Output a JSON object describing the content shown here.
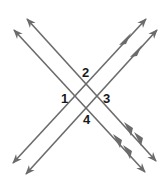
{
  "diagram": {
    "line_color": "#6b6b6b",
    "label_color": "#1a1a1a",
    "lines": [
      {
        "id": "nwse-1",
        "x1": 14,
        "y1": 30,
        "x2": 145,
        "y2": 172,
        "markers": "double"
      },
      {
        "id": "nwse-2",
        "x1": 27,
        "y1": 19,
        "x2": 156,
        "y2": 161,
        "markers": "double"
      },
      {
        "id": "swne-1",
        "x1": 13,
        "y1": 163,
        "x2": 146,
        "y2": 19,
        "markers": "single"
      },
      {
        "id": "swne-2",
        "x1": 26,
        "y1": 174,
        "x2": 157,
        "y2": 30,
        "markers": "single"
      }
    ],
    "angle_labels": [
      {
        "text": "2",
        "x": 86,
        "y": 76
      },
      {
        "text": "1",
        "x": 65,
        "y": 102
      },
      {
        "text": "3",
        "x": 107,
        "y": 102
      },
      {
        "text": "4",
        "x": 87,
        "y": 123
      }
    ]
  }
}
